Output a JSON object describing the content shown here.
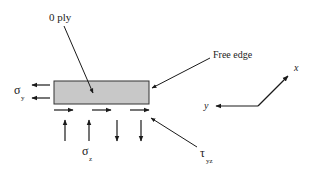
{
  "diagram": {
    "ply_label": "0 ply",
    "free_edge_label": "Free edge",
    "sigma_y": {
      "symbol": "σ",
      "subscript": "y"
    },
    "sigma_z": {
      "symbol": "σ",
      "subscript": "z"
    },
    "tau_yz": {
      "symbol": "τ",
      "subscript": "yz"
    },
    "axis_x_label": "x",
    "axis_y_label": "y",
    "colors": {
      "ply_fill": "#c8c8c8",
      "ink": "#1a1a1a"
    }
  }
}
